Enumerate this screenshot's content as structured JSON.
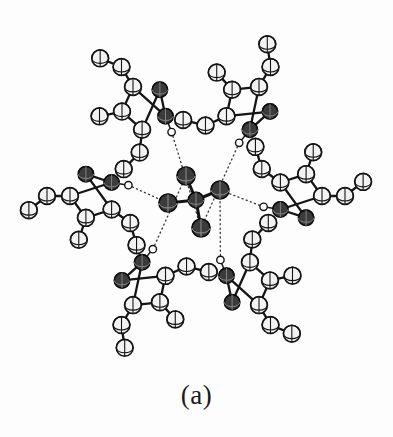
{
  "figure": {
    "caption": "(a)",
    "kind": "ortep-crystal-structure-diagram",
    "background_color": "#ffffff",
    "line_color": "#151515",
    "carbon_fill": "#f2f2f2",
    "nitrogen_fill": "#3a3a3a",
    "oxygen_fill": "#3a3a3a",
    "hydrogen_fill": "#ffffff",
    "hbond_style": "dotted"
  },
  "chart_data": {
    "type": "scatter",
    "title": "ORTEP thermal-ellipsoid plot: six pyrazole rings hydrogen bonded to a central tetrahedral anion",
    "xlabel": "",
    "ylabel": "",
    "xlim": [
      0,
      393
    ],
    "ylim": [
      0,
      390
    ],
    "grid": false,
    "legend": "none",
    "annotations": [
      "(a)"
    ],
    "atom_types": [
      {
        "name": "carbon",
        "symbol": "C",
        "radius": 8.4,
        "fill": "#f2f2f2",
        "stroke": "#151515",
        "count": 36
      },
      {
        "name": "nitrogen",
        "symbol": "N",
        "radius": 7.6,
        "fill": "#3a3a3a",
        "stroke": "#101010",
        "count": 12
      },
      {
        "name": "oxygen",
        "symbol": "O",
        "radius": 9.0,
        "fill": "#3a3a3a",
        "stroke": "#101010",
        "count": 4
      },
      {
        "name": "anion-center",
        "symbol": "X",
        "radius": 8.2,
        "fill": "#3a3a3a",
        "stroke": "#101010",
        "count": 1
      },
      {
        "name": "hydrogen",
        "symbol": "H",
        "radius": 3.6,
        "fill": "#ffffff",
        "stroke": "#151515",
        "count": 6
      }
    ],
    "bond_types": [
      {
        "name": "covalent-bond",
        "style": "solid",
        "width": 2.2,
        "color": "#151515"
      },
      {
        "name": "hydrogen-bond",
        "style": "dotted",
        "width": 1.3,
        "color": "#333333"
      }
    ],
    "center": {
      "x": 196,
      "y": 196
    },
    "anion": {
      "center": {
        "x": 196,
        "y": 200
      },
      "oxygens": [
        {
          "id": "O1",
          "x": 186,
          "y": 176
        },
        {
          "id": "O2",
          "x": 220,
          "y": 190
        },
        {
          "id": "O3",
          "x": 168,
          "y": 203
        },
        {
          "id": "O4",
          "x": 201,
          "y": 228
        }
      ]
    },
    "rings": [
      {
        "id": "ring-top-left",
        "angle_deg": 120,
        "cx": 143,
        "cy": 104,
        "nh_hydrogen": {
          "x": 173,
          "y": 146
        }
      },
      {
        "id": "ring-top-right",
        "angle_deg": 60,
        "cx": 250,
        "cy": 104,
        "nh_hydrogen": {
          "x": 228,
          "y": 146
        }
      },
      {
        "id": "ring-right",
        "angle_deg": 0,
        "cx": 303,
        "cy": 196,
        "nh_hydrogen": {
          "x": 262,
          "y": 182
        }
      },
      {
        "id": "ring-bottom-right",
        "angle_deg": 300,
        "cx": 250,
        "cy": 289,
        "nh_hydrogen": {
          "x": 216,
          "y": 265
        }
      },
      {
        "id": "ring-bottom-left",
        "angle_deg": 240,
        "cx": 143,
        "cy": 289,
        "nh_hydrogen": {
          "x": 162,
          "y": 265
        }
      },
      {
        "id": "ring-left",
        "angle_deg": 180,
        "cx": 90,
        "cy": 196,
        "nh_hydrogen": {
          "x": 133,
          "y": 216
        }
      }
    ],
    "hydrogen_bonds": [
      {
        "from": "ring-top-left.H",
        "to": "O1",
        "style": "dotted"
      },
      {
        "from": "ring-top-right.H",
        "to": "O2",
        "style": "dotted"
      },
      {
        "from": "ring-right.H",
        "to": "O2",
        "style": "dotted"
      },
      {
        "from": "ring-bottom-right.H",
        "to": "O4",
        "style": "dotted"
      },
      {
        "from": "ring-bottom-left.H",
        "to": "O4",
        "style": "dotted"
      },
      {
        "from": "ring-left.H",
        "to": "O3",
        "style": "dotted"
      }
    ]
  }
}
